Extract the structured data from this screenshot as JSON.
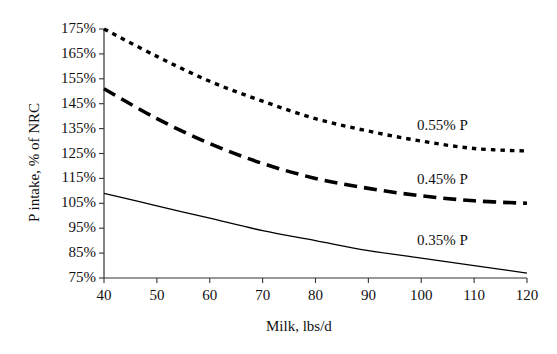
{
  "chart_data": {
    "type": "line",
    "title": "",
    "xlabel": "Milk, lbs/d",
    "ylabel": "P intake, % of NRC",
    "xlim": [
      40,
      120
    ],
    "ylim": [
      75,
      175
    ],
    "xticks": [
      "40",
      "50",
      "60",
      "70",
      "80",
      "90",
      "100",
      "110",
      "120"
    ],
    "yticks": [
      "175%",
      "165%",
      "155%",
      "145%",
      "135%",
      "125%",
      "115%",
      "105%",
      "95%",
      "85%",
      "75%"
    ],
    "grid": false,
    "legend_position": "inline-right",
    "x": [
      40,
      50,
      60,
      70,
      80,
      90,
      100,
      110,
      120
    ],
    "series": [
      {
        "name": "0.55% P",
        "style": "dotted",
        "color": "#000000",
        "values": [
          175,
          164,
          154,
          146,
          139,
          134,
          130,
          127,
          126
        ]
      },
      {
        "name": "0.45% P",
        "style": "dashed",
        "color": "#000000",
        "values": [
          151,
          139,
          129,
          121,
          115,
          111,
          108,
          106,
          105
        ]
      },
      {
        "name": "0.35% P",
        "style": "solid",
        "color": "#000000",
        "values": [
          109,
          104,
          99,
          94,
          90,
          86,
          83,
          80,
          77
        ]
      }
    ]
  },
  "axis": {
    "x_title": "Milk, lbs/d",
    "y_title": "P intake, % of NRC"
  },
  "labels": {
    "series_055": "0.55% P",
    "series_045": "0.45% P",
    "series_035": "0.35% P"
  }
}
